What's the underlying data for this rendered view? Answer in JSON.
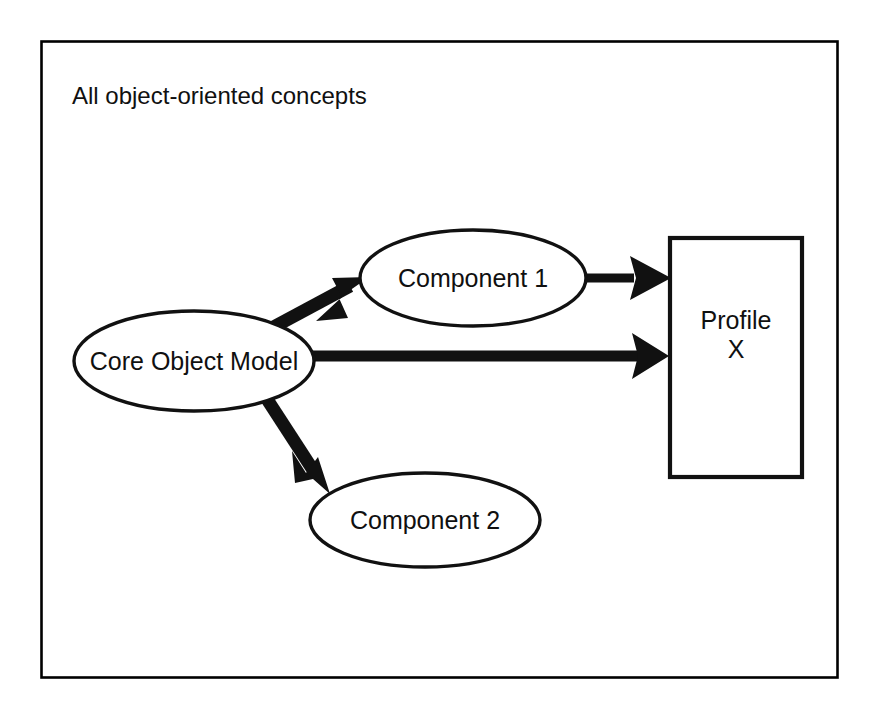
{
  "diagram": {
    "frame": {
      "title": "All object-oriented concepts"
    },
    "nodes": [
      {
        "id": "core-object-model",
        "shape": "ellipse",
        "label": "Core Object Model",
        "cx": 194,
        "cy": 361,
        "rx": 120,
        "ry": 50
      },
      {
        "id": "component-1",
        "shape": "ellipse",
        "label": "Component 1",
        "cx": 473,
        "cy": 278,
        "rx": 113,
        "ry": 48
      },
      {
        "id": "component-2",
        "shape": "ellipse",
        "label": "Component 2",
        "cx": 425,
        "cy": 520,
        "rx": 115,
        "ry": 47
      },
      {
        "id": "profile-x",
        "shape": "rectangle",
        "label_line_1": "Profile",
        "label_line_2": "X",
        "x": 670,
        "y": 238,
        "width": 132,
        "height": 239
      }
    ],
    "edges": [
      {
        "id": "core-to-component-1",
        "from": "core-object-model",
        "to": "component-1",
        "style": "solid-thick-arrow"
      },
      {
        "id": "core-to-profile-x",
        "from": "core-object-model",
        "to": "profile-x",
        "style": "solid-thick-arrow"
      },
      {
        "id": "core-to-component-2",
        "from": "core-object-model",
        "to": "component-2",
        "style": "solid-thick-arrow"
      },
      {
        "id": "component-1-to-profile-x",
        "from": "component-1",
        "to": "profile-x",
        "style": "solid-thick-arrow"
      }
    ]
  }
}
